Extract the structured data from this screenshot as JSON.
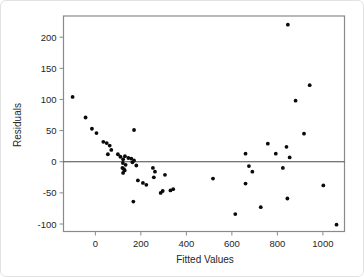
{
  "figure": {
    "background": "#ffffff",
    "outer_border_color": "#e2e2e2"
  },
  "chart_data": {
    "type": "scatter",
    "title": "",
    "xlabel": "Fitted Values",
    "ylabel": "Residuals",
    "xlim": [
      -140,
      1095
    ],
    "ylim": [
      -112,
      234
    ],
    "x_ticks": [
      0,
      200,
      400,
      600,
      800,
      1000
    ],
    "y_ticks": [
      200,
      150,
      100,
      50,
      0,
      -50,
      -100
    ],
    "grid": false,
    "zero_line": true,
    "legend": "none",
    "point_color": "#0a0a0a",
    "axis_color": "#8a8a8a",
    "zero_line_color": "#4a4a4a",
    "label_color": "#262626",
    "points": [
      {
        "x": -100,
        "y": 104
      },
      {
        "x": -43,
        "y": 71
      },
      {
        "x": -15,
        "y": 53
      },
      {
        "x": 5,
        "y": 46
      },
      {
        "x": 35,
        "y": 32
      },
      {
        "x": 50,
        "y": 30
      },
      {
        "x": 63,
        "y": 26
      },
      {
        "x": 70,
        "y": 19
      },
      {
        "x": 55,
        "y": 12
      },
      {
        "x": 170,
        "y": 51
      },
      {
        "x": 99,
        "y": 12
      },
      {
        "x": 110,
        "y": 8
      },
      {
        "x": 130,
        "y": 9
      },
      {
        "x": 145,
        "y": 6
      },
      {
        "x": 158,
        "y": 5
      },
      {
        "x": 170,
        "y": 2
      },
      {
        "x": 122,
        "y": 4
      },
      {
        "x": 121,
        "y": -2
      },
      {
        "x": 133,
        "y": -5
      },
      {
        "x": 119,
        "y": -10
      },
      {
        "x": 126,
        "y": -12
      },
      {
        "x": 129,
        "y": -14
      },
      {
        "x": 122,
        "y": -18
      },
      {
        "x": 180,
        "y": -6
      },
      {
        "x": 163,
        "y": -1
      },
      {
        "x": 187,
        "y": -30
      },
      {
        "x": 209,
        "y": -34
      },
      {
        "x": 224,
        "y": -37
      },
      {
        "x": 167,
        "y": -64
      },
      {
        "x": 253,
        "y": -10
      },
      {
        "x": 262,
        "y": -16
      },
      {
        "x": 257,
        "y": -25
      },
      {
        "x": 306,
        "y": -21
      },
      {
        "x": 287,
        "y": -50
      },
      {
        "x": 296,
        "y": -47
      },
      {
        "x": 330,
        "y": -46
      },
      {
        "x": 342,
        "y": -44
      },
      {
        "x": 517,
        "y": -27
      },
      {
        "x": 615,
        "y": -84
      },
      {
        "x": 660,
        "y": 13
      },
      {
        "x": 675,
        "y": -7
      },
      {
        "x": 690,
        "y": -16
      },
      {
        "x": 660,
        "y": -35
      },
      {
        "x": 727,
        "y": -73
      },
      {
        "x": 758,
        "y": 29
      },
      {
        "x": 793,
        "y": 13
      },
      {
        "x": 824,
        "y": -10
      },
      {
        "x": 840,
        "y": 24
      },
      {
        "x": 854,
        "y": 7
      },
      {
        "x": 844,
        "y": -59
      },
      {
        "x": 846,
        "y": 220
      },
      {
        "x": 880,
        "y": 98
      },
      {
        "x": 917,
        "y": 45
      },
      {
        "x": 942,
        "y": 123
      },
      {
        "x": 1002,
        "y": -38
      },
      {
        "x": 1060,
        "y": -101
      }
    ]
  }
}
